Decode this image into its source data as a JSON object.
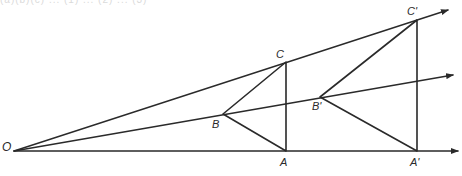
{
  "header": {
    "cropped_text": "(a)(b)(c) ... (1) ... (2) ... (3)"
  },
  "diagram": {
    "center": {
      "label": "O",
      "x": 14,
      "y": 151
    },
    "original_triangle": {
      "A": {
        "label": "A",
        "x": 286,
        "y": 151
      },
      "B": {
        "label": "B",
        "x": 223,
        "y": 114
      },
      "C": {
        "label": "C",
        "x": 286,
        "y": 62
      }
    },
    "image_triangle": {
      "A": {
        "label": "A'",
        "x": 417,
        "y": 151
      },
      "B": {
        "label": "B'",
        "x": 320,
        "y": 97
      },
      "C": {
        "label": "C'",
        "x": 417,
        "y": 20
      }
    },
    "rays": [
      {
        "name": "ray-OA",
        "from": "O",
        "through": "A",
        "end": {
          "x": 460,
          "y": 151
        }
      },
      {
        "name": "ray-OB",
        "from": "O",
        "through": "B",
        "end": {
          "x": 455,
          "y": 75
        }
      },
      {
        "name": "ray-OC",
        "from": "O",
        "through": "C",
        "end": {
          "x": 450,
          "y": 10
        }
      }
    ],
    "stroke_color": "#2a2a2a",
    "background": "#ffffff"
  }
}
